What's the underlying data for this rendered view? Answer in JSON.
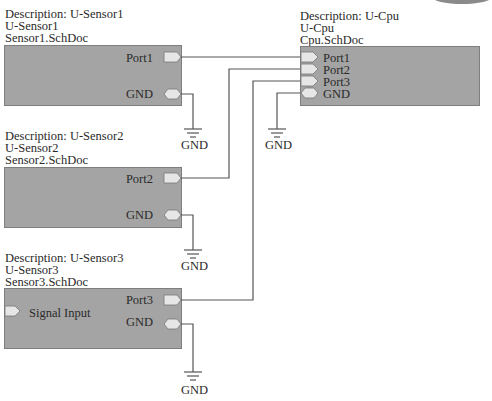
{
  "colors": {
    "sheet_fill": "#a4a4a4",
    "sheet_border": "#7e7e7e",
    "wire": "#555555",
    "port_fill": "#e6e6e6"
  },
  "sheets": {
    "sensor1": {
      "description": "Description: U-Sensor1",
      "designator": "U-Sensor1",
      "filename": "Sensor1.SchDoc",
      "ports": [
        "Port1",
        "GND"
      ]
    },
    "sensor2": {
      "description": "Description: U-Sensor2",
      "designator": "U-Sensor2",
      "filename": "Sensor2.SchDoc",
      "ports": [
        "Port2",
        "GND"
      ]
    },
    "sensor3": {
      "description": "Description: U-Sensor3",
      "designator": "U-Sensor3",
      "filename": "Sensor3.SchDoc",
      "ports": [
        "Port3",
        "GND"
      ],
      "input_port": "Signal Input"
    },
    "cpu": {
      "description": "Description: U-Cpu",
      "designator": "U-Cpu",
      "filename": "Cpu.SchDoc",
      "ports": [
        "Port1",
        "Port2",
        "Port3",
        "GND"
      ]
    }
  },
  "ground_symbols": {
    "sensor1_gnd": "GND",
    "sensor2_gnd": "GND",
    "sensor3_gnd": "GND",
    "cpu_gnd": "GND"
  }
}
